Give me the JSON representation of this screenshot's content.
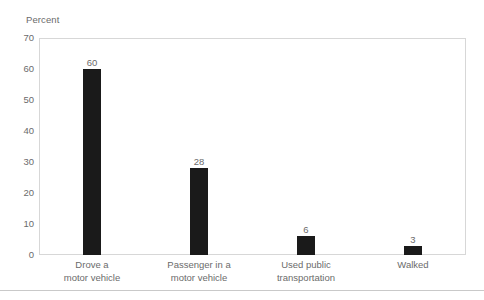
{
  "chart_data": {
    "type": "bar",
    "title": "",
    "subtitle": "",
    "xlabel": "",
    "ylabel": "Percent",
    "ylim": [
      0,
      70
    ],
    "yticks": [
      0,
      10,
      20,
      30,
      40,
      50,
      60,
      70
    ],
    "grid": false,
    "legend": null,
    "orientation": "vertical",
    "bar_color": "#1a1a1a",
    "categories": [
      "Drove a motor vehicle",
      "Passenger in a motor vehicle",
      "Used public transportation",
      "Walked"
    ],
    "category_lines": [
      [
        "Drove a",
        "motor vehicle"
      ],
      [
        "Passenger in a",
        "motor vehicle"
      ],
      [
        "Used public",
        "transportation"
      ],
      [
        "Walked",
        ""
      ]
    ],
    "values": [
      60,
      28,
      6,
      3
    ],
    "data_labels": [
      "60",
      "28",
      "6",
      "3"
    ]
  },
  "axis": {
    "y_title": "Percent",
    "tick_labels": [
      "70",
      "60",
      "50",
      "40",
      "30",
      "20",
      "10",
      "0"
    ]
  },
  "colors": {
    "bar": "#1a1a1a",
    "text": "#6b6b6b",
    "plot_border": "#d7d7d7",
    "rule": "#c9c9c9",
    "background": "#ffffff"
  }
}
